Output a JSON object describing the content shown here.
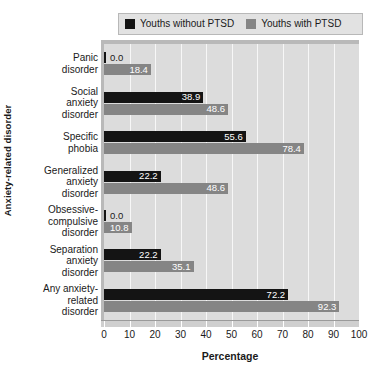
{
  "chart_data": {
    "type": "bar",
    "orientation": "horizontal",
    "title": "",
    "xlabel": "Percentage",
    "ylabel": "Anxiety-related disorder",
    "xlim": [
      0,
      100
    ],
    "xticks": [
      0,
      10,
      20,
      30,
      40,
      50,
      60,
      70,
      80,
      90,
      100
    ],
    "grid": "vertical",
    "legend_position": "top",
    "categories": [
      "Panic disorder",
      "Social anxiety disorder",
      "Specific phobia",
      "Generalized anxiety disorder",
      "Obsessive-compulsive disorder",
      "Separation anxiety disorder",
      "Any anxiety-related disorder"
    ],
    "category_lines": [
      [
        "Panic",
        "disorder"
      ],
      [
        "Social",
        "anxiety",
        "disorder"
      ],
      [
        "Specific",
        "phobia"
      ],
      [
        "Generalized",
        "anxiety",
        "disorder"
      ],
      [
        "Obsessive-",
        "compulsive",
        "disorder"
      ],
      [
        "Separation",
        "anxiety",
        "disorder"
      ],
      [
        "Any anxiety-",
        "related",
        "disorder"
      ]
    ],
    "series": [
      {
        "name": "Youths without PTSD",
        "color": "#141414",
        "values": [
          0.0,
          38.9,
          55.6,
          22.2,
          0.0,
          22.2,
          72.2
        ],
        "labels": [
          "0.0",
          "38.9",
          "55.6",
          "22.2",
          "0.0",
          "22.2",
          "72.2"
        ]
      },
      {
        "name": "Youths with PTSD",
        "color": "#858585",
        "values": [
          18.4,
          48.6,
          78.4,
          48.6,
          10.8,
          35.1,
          92.3
        ],
        "labels": [
          "18.4",
          "48.6",
          "78.4",
          "48.6",
          "10.8",
          "35.1",
          "92.3"
        ]
      }
    ]
  },
  "legend": {
    "items": [
      {
        "label": "Youths without PTSD",
        "color": "#141414"
      },
      {
        "label": "Youths with PTSD",
        "color": "#858585"
      }
    ]
  },
  "axes": {
    "x_title": "Percentage",
    "y_title": "Anxiety-related disorder",
    "x_tick_labels": [
      "0",
      "10",
      "20",
      "30",
      "40",
      "50",
      "60",
      "70",
      "80",
      "90",
      "100"
    ]
  },
  "colors": {
    "series_without_ptsd": "#141414",
    "series_with_ptsd": "#858585",
    "plot_background": "#dcdcdc",
    "gridline": "#f7f7f7",
    "page_background": "#ffffff",
    "legend_background": "#e2e2e2"
  }
}
